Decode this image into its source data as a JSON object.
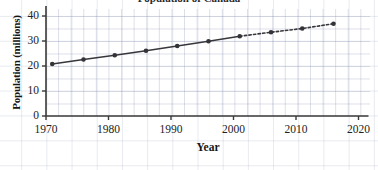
{
  "chart_data": {
    "type": "line",
    "title": "Population of Canada",
    "xlabel": "Year",
    "ylabel": "Population (millions)",
    "xlim": [
      1968,
      2022
    ],
    "ylim": [
      0,
      44
    ],
    "xticks": [
      1970,
      1980,
      1990,
      2000,
      2010,
      2020
    ],
    "yticks": [
      0,
      10,
      20,
      30,
      40
    ],
    "grid": true,
    "legend": "none",
    "series": [
      {
        "name": "Observed population",
        "style": "solid",
        "x": [
          1971,
          1976,
          1981,
          1986,
          1991,
          1996,
          2001
        ],
        "values": [
          20.8,
          22.6,
          24.3,
          26.1,
          28.0,
          29.9,
          31.9
        ]
      },
      {
        "name": "Projected population",
        "style": "dashed",
        "x": [
          2001,
          2006,
          2011,
          2016
        ],
        "values": [
          31.9,
          33.5,
          35.0,
          36.9
        ]
      }
    ],
    "markers": [
      {
        "x": 1971,
        "y": 20.8
      },
      {
        "x": 1976,
        "y": 22.6
      },
      {
        "x": 1981,
        "y": 24.3
      },
      {
        "x": 1986,
        "y": 26.1
      },
      {
        "x": 1991,
        "y": 28.0
      },
      {
        "x": 1996,
        "y": 29.9
      },
      {
        "x": 2001,
        "y": 31.9
      },
      {
        "x": 2006,
        "y": 33.5
      },
      {
        "x": 2011,
        "y": 35.0
      },
      {
        "x": 2016,
        "y": 36.9
      }
    ],
    "colors": {
      "line": "#37373c",
      "marker": "#333338",
      "axis": "#3a3a3a",
      "grid": "#8c96b4"
    }
  },
  "axis": {
    "y_title": "Population (millions)",
    "x_title": "Year",
    "y_tick_labels": [
      "0",
      "10",
      "20",
      "30",
      "40"
    ],
    "x_tick_labels": [
      "1970",
      "1980",
      "1990",
      "2000",
      "2010",
      "2020"
    ]
  },
  "title": {
    "text": "Population of Canada"
  }
}
